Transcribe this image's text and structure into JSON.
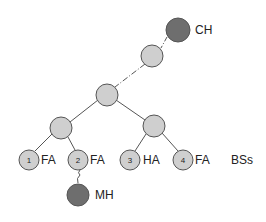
{
  "diagram": {
    "colors": {
      "light_node": "#cfcfcf",
      "dark_node": "#6e6e6e",
      "stroke": "#555555",
      "text": "#222222"
    },
    "nodes": {
      "ch": {
        "label": "CH"
      },
      "mh": {
        "label": "MH"
      },
      "leaves": [
        {
          "number": "1",
          "label": "FA"
        },
        {
          "number": "2",
          "label": "FA"
        },
        {
          "number": "3",
          "label": "HA"
        },
        {
          "number": "4",
          "label": "FA"
        }
      ]
    },
    "group_label": "BSs"
  }
}
